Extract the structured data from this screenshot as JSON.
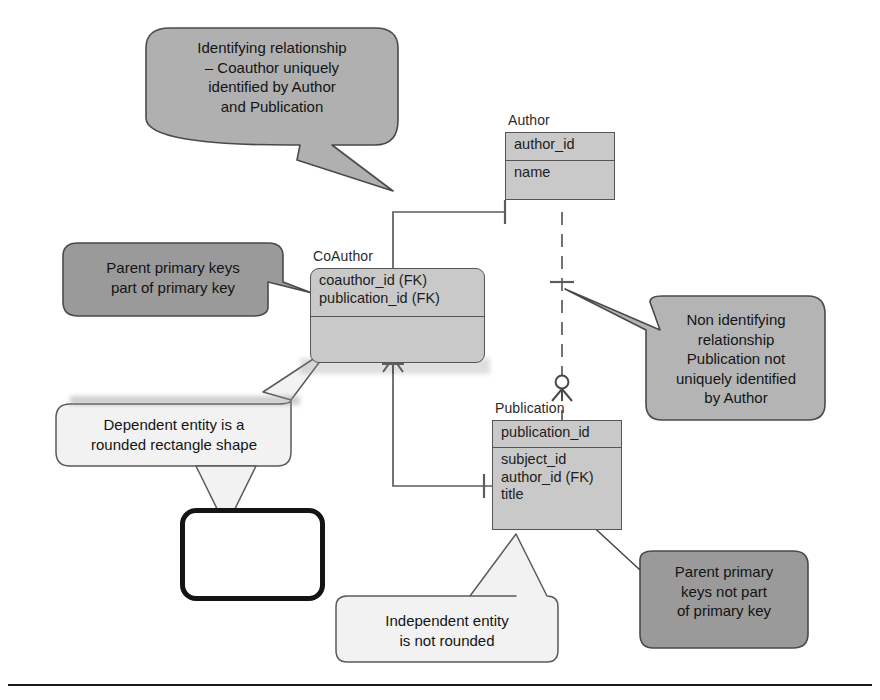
{
  "diagram": {
    "type": "entity-relationship-diagram",
    "notation": "crow's foot / IDEF1X",
    "entities": [
      {
        "id": "author",
        "name": "Author",
        "shape": "rectangle",
        "kind": "independent",
        "primary_keys": [
          "author_id"
        ],
        "attributes": [
          "name"
        ]
      },
      {
        "id": "coauthor",
        "name": "CoAuthor",
        "shape": "rounded-rectangle",
        "kind": "dependent",
        "primary_keys": [
          "coauthor_id (FK)",
          "publication_id (FK)"
        ],
        "attributes": []
      },
      {
        "id": "publication",
        "name": "Publication",
        "shape": "rectangle",
        "kind": "independent",
        "primary_keys": [
          "publication_id"
        ],
        "attributes": [
          "subject_id",
          "author_id (FK)",
          "title"
        ]
      }
    ],
    "relationships": [
      {
        "id": "author-coauthor",
        "from": "Author",
        "to": "CoAuthor",
        "line": "solid",
        "kind": "identifying",
        "from_cardinality": "one",
        "to_cardinality": "zero-or-many"
      },
      {
        "id": "author-publication",
        "from": "Author",
        "to": "Publication",
        "line": "dashed",
        "kind": "non-identifying",
        "from_cardinality": "one",
        "to_cardinality": "zero-or-many"
      },
      {
        "id": "coauthor-publication",
        "from": "CoAuthor",
        "to": "Publication",
        "line": "solid",
        "kind": "identifying",
        "from_cardinality": "many",
        "to_cardinality": "one"
      }
    ]
  },
  "callouts": [
    {
      "id": "identifying",
      "text": "Identifying relationship\n– Coauthor uniquely\nidentified by  Author\nand Publication",
      "fill": "#b0b0b0",
      "stroke": "#4a4a4a"
    },
    {
      "id": "parent-pk-part",
      "text": "Parent primary keys\npart of primary key",
      "fill": "#9a9a9a",
      "stroke": "#4a4a4a"
    },
    {
      "id": "non-identifying",
      "text": "Non identifying\nrelationship\nPublication not\nuniquely identified\nby Author",
      "fill": "#b4b4b4",
      "stroke": "#4a4a4a"
    },
    {
      "id": "dependent-entity",
      "text": "Dependent entity is a\nrounded rectangle shape",
      "fill": "#f2f2f2",
      "stroke": "#5a5a5a"
    },
    {
      "id": "independent-entity",
      "text": "Independent entity\nis not rounded",
      "fill": "#f2f2f2",
      "stroke": "#5a5a5a"
    },
    {
      "id": "parent-pk-not-part",
      "text": "Parent primary\nkeys not part\nof primary key",
      "fill": "#9a9a9a",
      "stroke": "#4a4a4a"
    }
  ],
  "sample_shape": {
    "id": "rounded-rectangle-example",
    "label": "",
    "stroke": "#141414",
    "fill": "#ffffff"
  },
  "colors": {
    "entity_fill": "#c9c9c9",
    "entity_stroke": "#555555",
    "line": "#5c5c5c",
    "page_background": "#ffffff",
    "text": "#1d1d1d"
  }
}
